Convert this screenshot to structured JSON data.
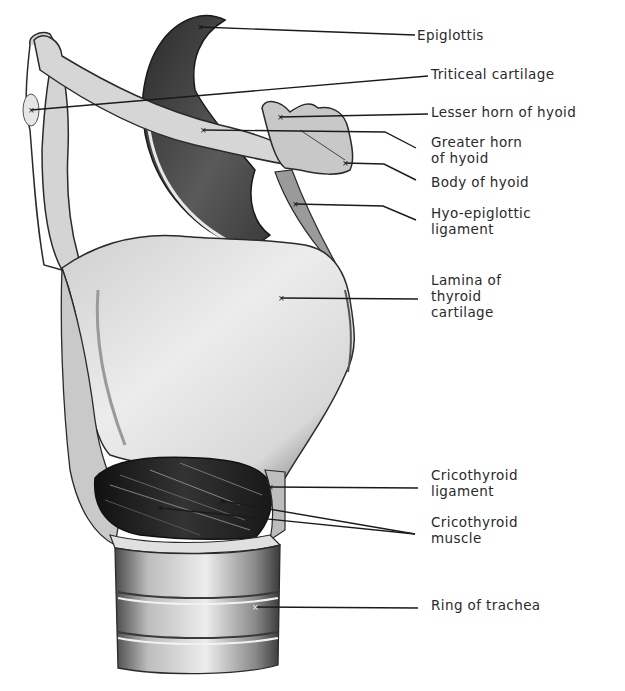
{
  "figure": {
    "colors": {
      "background": "#ffffff",
      "ink": "#1a1a1a",
      "cartilage": "#dcdcdc",
      "shadow": "#4a4a4a",
      "dark": "#1e1e1e"
    }
  },
  "labels": [
    {
      "id": "epiglottis",
      "lines": [
        "Epiglottis"
      ],
      "x": 417,
      "y": 27,
      "line": [
        [
          200,
          27
        ],
        [
          415,
          35
        ]
      ]
    },
    {
      "id": "triticeal-cartilage",
      "lines": [
        "Triticeal cartilage"
      ],
      "x": 431,
      "y": 66,
      "line": [
        [
          31,
          110
        ],
        [
          428,
          76
        ]
      ]
    },
    {
      "id": "lesser-horn-of-hyoid",
      "lines": [
        "Lesser horn of hyoid"
      ],
      "x": 431,
      "y": 104,
      "line": [
        [
          280,
          117
        ],
        [
          428,
          114
        ]
      ]
    },
    {
      "id": "greater-horn-of-hyoid",
      "lines": [
        "Greater horn",
        "of hyoid"
      ],
      "x": 431,
      "y": 134,
      "line": [
        [
          203,
          130
        ],
        [
          385,
          132
        ],
        [
          416,
          148
        ]
      ]
    },
    {
      "id": "body-of-hyoid",
      "lines": [
        "Body of hyoid"
      ],
      "x": 431,
      "y": 174,
      "line": [
        [
          345,
          163
        ],
        [
          384,
          164
        ],
        [
          416,
          180
        ]
      ]
    },
    {
      "id": "hyo-epiglottic-ligament",
      "lines": [
        "Hyo-epiglottic",
        "ligament"
      ],
      "x": 431,
      "y": 205,
      "line": [
        [
          295,
          204
        ],
        [
          383,
          206
        ],
        [
          416,
          220
        ]
      ]
    },
    {
      "id": "lamina-of-thyroid-cartilage",
      "lines": [
        "Lamina of",
        "thyroid",
        "cartilage"
      ],
      "x": 431,
      "y": 272,
      "line": [
        [
          281,
          298
        ],
        [
          418,
          299
        ]
      ]
    },
    {
      "id": "cricothyroid-ligament",
      "lines": [
        "Cricothyroid",
        "ligament"
      ],
      "x": 431,
      "y": 467,
      "line": [
        [
          270,
          487
        ],
        [
          418,
          488
        ]
      ]
    },
    {
      "id": "cricothyroid-muscle",
      "lines": [
        "Cricothyroid",
        "muscle"
      ],
      "x": 431,
      "y": 514,
      "line": [
        [
          160,
          508
        ],
        [
          415,
          534
        ]
      ],
      "line2": [
        [
          222,
          501
        ],
        [
          415,
          534
        ]
      ]
    },
    {
      "id": "ring-of-trachea",
      "lines": [
        "Ring of trachea"
      ],
      "x": 431,
      "y": 597,
      "line": [
        [
          255,
          607
        ],
        [
          418,
          608
        ]
      ]
    }
  ]
}
